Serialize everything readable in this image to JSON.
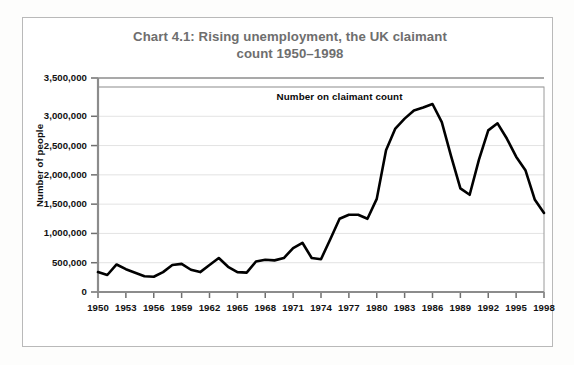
{
  "figure": {
    "title": "Chart 4.1: Rising unemployment, the UK claimant count 1950–1998",
    "title_line1": "Chart 4.1: Rising unemployment, the UK claimant",
    "title_line2": "count 1950–1998",
    "title_color": "#6e6e6e",
    "border_color": "#b9b9b9",
    "background_color": "#ffffff"
  },
  "chart_data": {
    "type": "line",
    "title": "Chart 4.1: Rising unemployment, the UK claimant count 1950–1998",
    "xlabel": "",
    "ylabel": "Number of people",
    "xlim": [
      1950,
      1998
    ],
    "ylim": [
      0,
      3500000
    ],
    "grid": true,
    "grid_color": "#e3e3e3",
    "legend_position": "inside-annotation",
    "series": [
      {
        "name": "Number on claimant count",
        "color": "#000000",
        "line_width": 2.6,
        "x": [
          1950,
          1951,
          1952,
          1953,
          1954,
          1955,
          1956,
          1957,
          1958,
          1959,
          1960,
          1961,
          1962,
          1963,
          1964,
          1965,
          1966,
          1967,
          1968,
          1969,
          1970,
          1971,
          1972,
          1973,
          1974,
          1975,
          1976,
          1977,
          1978,
          1979,
          1980,
          1981,
          1982,
          1983,
          1984,
          1985,
          1986,
          1987,
          1988,
          1989,
          1990,
          1991,
          1992,
          1993,
          1994,
          1995,
          1996,
          1997,
          1998
        ],
        "values": [
          340000,
          290000,
          470000,
          390000,
          330000,
          270000,
          260000,
          340000,
          460000,
          480000,
          380000,
          340000,
          460000,
          580000,
          430000,
          340000,
          330000,
          520000,
          550000,
          540000,
          580000,
          750000,
          840000,
          580000,
          560000,
          900000,
          1250000,
          1320000,
          1320000,
          1250000,
          1590000,
          2420000,
          2790000,
          2960000,
          3100000,
          3150000,
          3210000,
          2900000,
          2320000,
          1770000,
          1660000,
          2260000,
          2760000,
          2880000,
          2620000,
          2310000,
          2080000,
          1580000,
          1350000
        ]
      }
    ],
    "annotations": [
      {
        "text": "Number on claimant count",
        "x": 1976,
        "y": 3330000,
        "color": "#0a0a0a",
        "bold": true
      }
    ],
    "y_ticks": [
      0,
      500000,
      1000000,
      1500000,
      2000000,
      2500000,
      3000000,
      3500000
    ],
    "y_tick_labels": [
      "0",
      "500,000",
      "1,000,000",
      "1,500,000",
      "2,000,000",
      "2,500,000",
      "3,000,000",
      "3,500,000"
    ],
    "x_ticks": [
      1950,
      1953,
      1956,
      1959,
      1962,
      1965,
      1968,
      1971,
      1974,
      1977,
      1980,
      1983,
      1986,
      1989,
      1992,
      1995,
      1998
    ],
    "x_tick_labels": [
      "1950",
      "1953",
      "1956",
      "1959",
      "1962",
      "1965",
      "1968",
      "1971",
      "1974",
      "1977",
      "1980",
      "1983",
      "1986",
      "1989",
      "1992",
      "1995",
      "1998"
    ]
  }
}
